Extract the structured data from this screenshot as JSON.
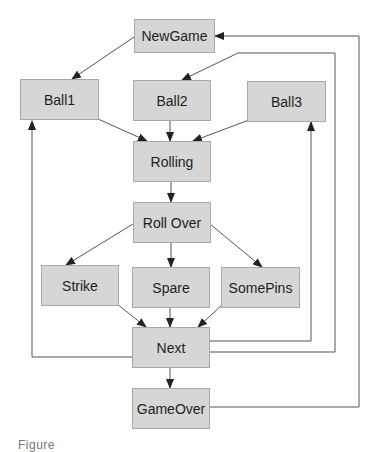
{
  "diagram": {
    "type": "state-transition",
    "nodes": {
      "newgame": {
        "label": "NewGame"
      },
      "ball1": {
        "label": "Ball1"
      },
      "ball2": {
        "label": "Ball2"
      },
      "ball3": {
        "label": "Ball3"
      },
      "rolling": {
        "label": "Rolling"
      },
      "rollover": {
        "label": "Roll Over"
      },
      "strike": {
        "label": "Strike"
      },
      "spare": {
        "label": "Spare"
      },
      "somepins": {
        "label": "SomePins"
      },
      "next": {
        "label": "Next"
      },
      "gameover": {
        "label": "GameOver"
      }
    },
    "edges": [
      {
        "from": "NewGame",
        "to": "Ball1"
      },
      {
        "from": "Ball1",
        "to": "Rolling"
      },
      {
        "from": "Ball2",
        "to": "Rolling"
      },
      {
        "from": "Ball3",
        "to": "Rolling"
      },
      {
        "from": "Rolling",
        "to": "Roll Over"
      },
      {
        "from": "Roll Over",
        "to": "Strike"
      },
      {
        "from": "Roll Over",
        "to": "Spare"
      },
      {
        "from": "Roll Over",
        "to": "SomePins"
      },
      {
        "from": "Strike",
        "to": "Next"
      },
      {
        "from": "Spare",
        "to": "Next"
      },
      {
        "from": "SomePins",
        "to": "Next"
      },
      {
        "from": "Next",
        "to": "GameOver"
      },
      {
        "from": "Next",
        "to": "Ball1"
      },
      {
        "from": "Next",
        "to": "Ball2"
      },
      {
        "from": "Next",
        "to": "Ball3"
      },
      {
        "from": "GameOver",
        "to": "NewGame"
      }
    ],
    "colors": {
      "node_fill": "#d6d6d6",
      "node_border": "#a9a9a9",
      "edge": "#333333"
    }
  },
  "caption": {
    "text": "Figure"
  }
}
